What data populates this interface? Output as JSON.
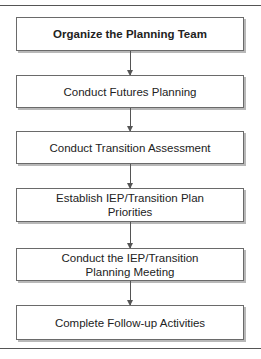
{
  "diagram": {
    "type": "vertical-flowchart",
    "steps": [
      {
        "label": "Organize the Planning Team",
        "bold": true
      },
      {
        "label": "Conduct Futures Planning",
        "bold": false
      },
      {
        "label": "Conduct Transition Assessment",
        "bold": false
      },
      {
        "label": "Establish IEP/Transition Plan Priorities",
        "bold": false
      },
      {
        "label": "Conduct the IEP/Transition Planning Meeting",
        "bold": false
      },
      {
        "label": "Complete Follow-up Activities",
        "bold": false
      }
    ],
    "connectors": [
      {
        "from": 0,
        "to": 1
      },
      {
        "from": 1,
        "to": 2
      },
      {
        "from": 2,
        "to": 3
      },
      {
        "from": 3,
        "to": 4
      },
      {
        "from": 4,
        "to": 5
      }
    ],
    "colors": {
      "border": "#6a6a6a",
      "shadow": "#b8b8b8",
      "arrow": "#555555",
      "text": "#222222"
    }
  }
}
